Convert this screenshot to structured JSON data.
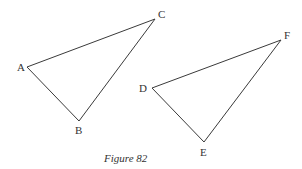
{
  "caption": "Figure 82",
  "colors": {
    "stroke": "#3a3a3a",
    "text": "#333333",
    "background": "#ffffff"
  },
  "triangles": [
    {
      "name": "ABC",
      "vertices": [
        {
          "label": "A",
          "x": 27,
          "y": 67,
          "lx": 17,
          "ly": 71
        },
        {
          "label": "B",
          "x": 79,
          "y": 121,
          "lx": 75,
          "ly": 134
        },
        {
          "label": "C",
          "x": 155,
          "y": 19,
          "lx": 158,
          "ly": 18
        }
      ]
    },
    {
      "name": "DEF",
      "vertices": [
        {
          "label": "D",
          "x": 152,
          "y": 88,
          "lx": 139,
          "ly": 92
        },
        {
          "label": "E",
          "x": 204,
          "y": 142,
          "lx": 200,
          "ly": 156
        },
        {
          "label": "F",
          "x": 281,
          "y": 40,
          "lx": 284,
          "ly": 39
        }
      ]
    }
  ]
}
